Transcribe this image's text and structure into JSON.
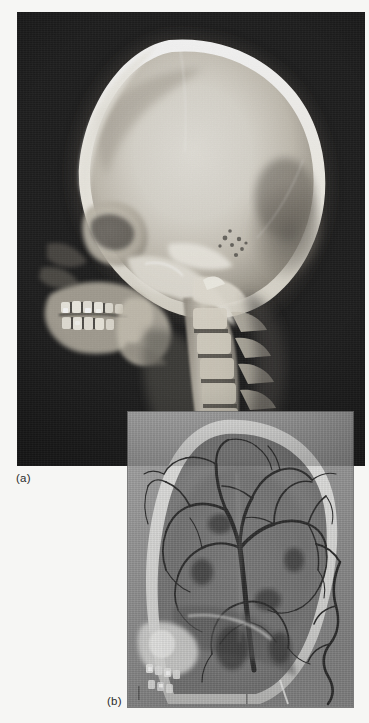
{
  "figure": {
    "background_color": "#f6f6f4",
    "panels": [
      {
        "id": "a",
        "label": "(a)",
        "caption_label": "(a)",
        "modality": "plain lateral skull radiograph",
        "background_color": "#0a0a0a",
        "bone_color": "#f2f0ea",
        "x": 17,
        "y": 12,
        "width": 348,
        "height": 454,
        "anatomy": [
          "cranial vault",
          "frontal bone",
          "parietal bone",
          "occipital bone",
          "lambdoid suture",
          "petrous temporal bone",
          "sella turcica",
          "maxilla with teeth",
          "mandible with teeth and fillings",
          "cervical vertebrae C1-C7"
        ]
      },
      {
        "id": "b",
        "label": "(b)",
        "caption_label": "(b)",
        "modality": "lateral cerebral angiogram",
        "background_color": "#8e8e8e",
        "vessel_color": "#1a1a1a",
        "x": 128,
        "y": 412,
        "width": 225,
        "height": 295,
        "anatomy": [
          "cranial vault outline",
          "internal carotid artery",
          "middle cerebral artery branches",
          "anterior cerebral artery",
          "sylvian triangle",
          "external carotid artery branches",
          "maxillary artery",
          "occipital artery",
          "skull base",
          "dentition with radiopaque fillings"
        ]
      }
    ]
  }
}
